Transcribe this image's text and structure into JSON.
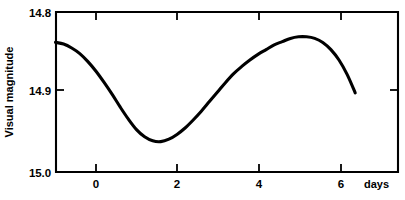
{
  "chart_data": {
    "type": "line",
    "title": "",
    "subtitle": "",
    "xlabel": "days",
    "ylabel": "Visual magnitude",
    "x_unit_label": "days",
    "xlim": [
      -1.05,
      7.4
    ],
    "ylim_display": [
      14.8,
      15.0
    ],
    "y_inverted": true,
    "grid": false,
    "legend": null,
    "x_ticks": [
      {
        "value": 0,
        "label": "0"
      },
      {
        "value": 2,
        "label": "2"
      },
      {
        "value": 4,
        "label": "4"
      },
      {
        "value": 6,
        "label": "6"
      }
    ],
    "y_ticks": [
      {
        "value": 14.8,
        "label": "14.8"
      },
      {
        "value": 14.9,
        "label": "14.9"
      },
      {
        "value": 15.0,
        "label": "15.0"
      }
    ],
    "series": [
      {
        "name": "light curve",
        "color": "#000000",
        "x": [
          -1.0,
          -0.8,
          -0.6,
          -0.4,
          -0.2,
          0.0,
          0.2,
          0.4,
          0.6,
          0.8,
          1.0,
          1.2,
          1.4,
          1.6,
          1.8,
          2.0,
          2.2,
          2.4,
          2.6,
          2.8,
          3.0,
          3.2,
          3.4,
          3.6,
          3.8,
          4.0,
          4.2,
          4.4,
          4.6,
          4.8,
          5.0,
          5.2,
          5.4,
          5.6,
          5.8,
          6.0,
          6.2,
          6.4
        ],
        "y": [
          14.838,
          14.84,
          14.845,
          14.852,
          14.862,
          14.874,
          14.888,
          14.903,
          14.919,
          14.934,
          14.947,
          14.956,
          14.961,
          14.962,
          14.959,
          14.953,
          14.945,
          14.935,
          14.924,
          14.912,
          14.9,
          14.888,
          14.877,
          14.868,
          14.86,
          14.853,
          14.847,
          14.841,
          14.837,
          14.833,
          14.831,
          14.831,
          14.833,
          14.838,
          14.847,
          14.86,
          14.878,
          14.901
        ]
      }
    ],
    "annotations": {
      "minimum": {
        "x": 1.45,
        "y": 14.962,
        "note": "faintest"
      },
      "maximum": {
        "x": 5.1,
        "y": 14.831,
        "note": "brightest"
      },
      "curve_start": {
        "x": -1.0,
        "y": 14.838
      },
      "curve_end": {
        "x": 6.4,
        "y": 14.901
      }
    }
  }
}
